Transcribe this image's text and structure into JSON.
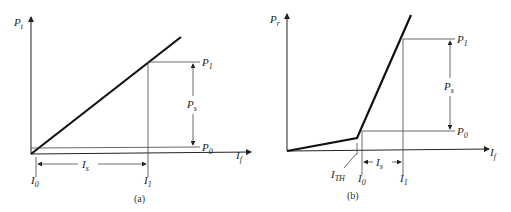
{
  "panels": [
    {
      "caption": "(a)",
      "y_axis": {
        "label": "P",
        "sub": "t"
      },
      "x_axis": {
        "label": "I",
        "sub": "f"
      },
      "levels": {
        "p1": {
          "label": "P",
          "sub": "1"
        },
        "p0": {
          "label": "P",
          "sub": "0"
        },
        "ps": {
          "label": "P",
          "sub": "s"
        }
      },
      "currents": {
        "i0": {
          "label": "I",
          "sub": "0"
        },
        "i1": {
          "label": "I",
          "sub": "1"
        },
        "is": {
          "label": "I",
          "sub": "s"
        }
      }
    },
    {
      "caption": "(b)",
      "y_axis": {
        "label": "P",
        "sub": "r"
      },
      "x_axis": {
        "label": "I",
        "sub": "f"
      },
      "levels": {
        "p1": {
          "label": "P",
          "sub": "1"
        },
        "p0": {
          "label": "P",
          "sub": "0"
        },
        "ps": {
          "label": "P",
          "sub": "s"
        }
      },
      "currents": {
        "ith": {
          "label": "I",
          "sub": "TH"
        },
        "i0": {
          "label": "I",
          "sub": "0"
        },
        "i1": {
          "label": "I",
          "sub": "1"
        },
        "is": {
          "label": "I",
          "sub": "s"
        }
      }
    }
  ]
}
